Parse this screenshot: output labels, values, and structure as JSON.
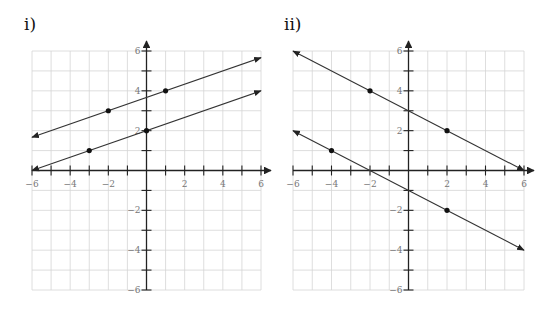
{
  "chart_data": [
    {
      "type": "line",
      "title": "i)",
      "xlim": [
        -6,
        6
      ],
      "ylim": [
        -6,
        6
      ],
      "grid": true,
      "x_tick_labels": [
        "-6",
        "-4",
        "-2",
        "2",
        "4",
        "6"
      ],
      "y_tick_labels": [
        "6",
        "4",
        "2",
        "-2",
        "-4",
        "-6"
      ],
      "series": [
        {
          "name": "upper line",
          "slope": 0.3333,
          "intercept": 3.6667,
          "x_range": [
            -6,
            6
          ],
          "arrows": "both",
          "points": [
            [
              -2,
              3
            ],
            [
              1,
              4
            ]
          ]
        },
        {
          "name": "lower line",
          "slope": 0.3333,
          "intercept": 2,
          "x_range": [
            -6,
            6
          ],
          "arrows": "both",
          "points": [
            [
              -3,
              1
            ],
            [
              0,
              2
            ]
          ]
        }
      ]
    },
    {
      "type": "line",
      "title": "ii)",
      "xlim": [
        -6,
        6
      ],
      "ylim": [
        -6,
        6
      ],
      "grid": true,
      "x_tick_labels": [
        "-6",
        "-4",
        "-2",
        "2",
        "4",
        "6"
      ],
      "y_tick_labels": [
        "6",
        "4",
        "2",
        "-2",
        "-4",
        "-6"
      ],
      "series": [
        {
          "name": "upper line",
          "slope": -0.5,
          "intercept": 3,
          "x_range": [
            -6,
            6
          ],
          "arrows": "both",
          "points": [
            [
              -2,
              4
            ],
            [
              2,
              2
            ]
          ]
        },
        {
          "name": "lower line",
          "slope": -0.5,
          "intercept": -1,
          "x_range": [
            -6,
            6
          ],
          "arrows": "both",
          "points": [
            [
              -4,
              1
            ],
            [
              2,
              -2
            ]
          ]
        }
      ]
    }
  ],
  "layout": [
    {
      "x0": 32,
      "x6": 261,
      "y6": 51,
      "yneg6": 290
    },
    {
      "x0": 293,
      "x6": 524,
      "y6": 51,
      "yneg6": 290
    }
  ]
}
